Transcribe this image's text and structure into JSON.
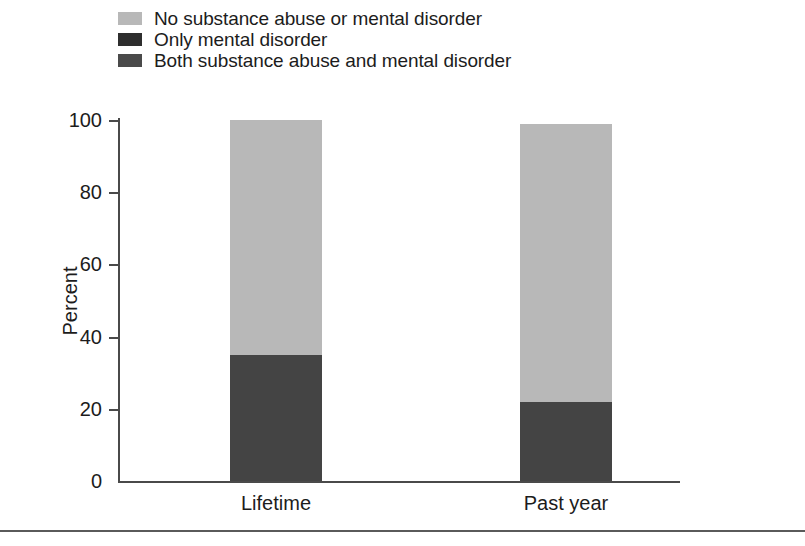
{
  "chart_data": {
    "type": "bar",
    "subtype": "stacked-bar",
    "title": "",
    "subtitle": "",
    "xlabel": "",
    "ylabel": "Percent",
    "categories": [
      "Lifetime",
      "Past year"
    ],
    "ylim": [
      0,
      100
    ],
    "yticks": [
      0,
      20,
      40,
      60,
      80,
      100
    ],
    "ytick_labels": [
      "0",
      "20",
      "40",
      "60",
      "80",
      "100"
    ],
    "grid": false,
    "legend_position": "top-left",
    "series": [
      {
        "name": "Both substance abuse and mental disorder",
        "color": "#444444",
        "values": [
          35,
          22
        ]
      },
      {
        "name": "Only mental disorder",
        "color": "#2e2e2e",
        "values": [
          0,
          0
        ]
      },
      {
        "name": "No substance abuse or mental disorder",
        "color": "#b8b8b8",
        "values": [
          65,
          77
        ]
      }
    ],
    "bar_totals": [
      100,
      99
    ]
  },
  "legend": {
    "items": [
      {
        "label": "No substance abuse or mental disorder",
        "color": "#b8b8b8",
        "swatch_name": "legend-swatch-no-disorder"
      },
      {
        "label": "Only mental disorder",
        "color": "#2e2e2e",
        "swatch_name": "legend-swatch-only-mental"
      },
      {
        "label": "Both substance abuse and mental disorder",
        "color": "#4a4a4a",
        "swatch_name": "legend-swatch-both"
      }
    ]
  },
  "axes": {
    "y_label": "Percent",
    "y_ticks": [
      "100",
      "80",
      "60",
      "40",
      "20",
      "0"
    ],
    "x_labels": [
      "Lifetime",
      "Past year"
    ]
  },
  "colors": {
    "light_gray": "#b8b8b8",
    "dark_gray": "#444444",
    "near_black": "#2e2e2e",
    "axis": "#4a4a4a",
    "text": "#1c1c1c",
    "background": "#ffffff"
  }
}
